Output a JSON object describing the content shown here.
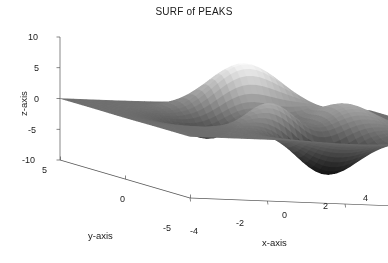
{
  "figure": {
    "title": "SURF of PEAKS",
    "background_color": "#ffffff",
    "text_color": "#1a1a1a",
    "axis_line_color": "#555555"
  },
  "axes": {
    "x": {
      "label": "x-axis",
      "ticks": [
        "-4",
        "-2",
        "0",
        "2",
        "4"
      ],
      "tick_values": [
        -4,
        -2,
        0,
        2,
        4
      ],
      "range": [
        -4,
        4
      ]
    },
    "y": {
      "label": "y-axis",
      "ticks": [
        "5",
        "0",
        "-5"
      ],
      "tick_values": [
        5,
        0,
        -5
      ],
      "range": [
        -5,
        5
      ]
    },
    "z": {
      "label": "z-axis",
      "ticks": [
        "10",
        "5",
        "0",
        "-5",
        "-10"
      ],
      "tick_values": [
        10,
        5,
        0,
        -5,
        -10
      ],
      "range": [
        -10,
        10
      ]
    }
  },
  "chart_data": {
    "type": "surface",
    "title": "SURF of PEAKS",
    "xlabel": "x-axis",
    "ylabel": "y-axis",
    "zlabel": "z-axis",
    "xlim": [
      -4,
      4
    ],
    "ylim": [
      -5,
      5
    ],
    "zlim": [
      -10,
      10
    ],
    "xticks": [
      -4,
      -2,
      0,
      2,
      4
    ],
    "yticks": [
      5,
      0,
      -5
    ],
    "zticks": [
      10,
      5,
      0,
      -5,
      -10
    ],
    "grid": false,
    "legend": null,
    "colormap": "gray",
    "shading": "faceted-flat",
    "function": "peaks",
    "function_expression": "z = 3*(1-x)^2*exp(-x^2-(y+1)^2) - 10*(x/5 - x^3 - y^5)*exp(-x^2-y^2) - (1/3)*exp(-(x+1)^2 - y^2)",
    "grid_resolution": 49,
    "view_azimuth": -37.5,
    "view_elevation": 30,
    "z_data_min": -6.55,
    "z_data_max": 8.08,
    "features": [
      {
        "name": "global maximum",
        "x": -0.01,
        "y": 1.58,
        "z": 8.08,
        "shade": "light"
      },
      {
        "name": "global minimum",
        "x": 0.23,
        "y": -1.63,
        "z": -6.55,
        "shade": "dark"
      },
      {
        "name": "secondary minimum",
        "x": -1.33,
        "y": -0.01,
        "z": -3.05,
        "shade": "dark"
      },
      {
        "name": "secondary maximum",
        "x": 1.29,
        "y": -0.01,
        "z": 3.59,
        "shade": "mid-light"
      }
    ]
  },
  "projection": {
    "origin_px": [
      60,
      160
    ],
    "x_axis_end_px": [
      370,
      172
    ],
    "y_axis_end_px": [
      190,
      198
    ],
    "z_axis_top_px": [
      60,
      37
    ]
  }
}
